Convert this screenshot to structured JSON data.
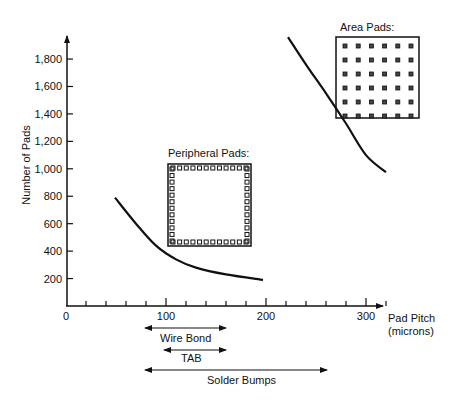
{
  "chart_data": {
    "type": "line",
    "title": "",
    "xlabel": "Pad Pitch (microns)",
    "xlabel_line1": "Pad Pitch",
    "xlabel_line2": "(microns)",
    "ylabel": "Number of Pads",
    "xlim": [
      0,
      330
    ],
    "ylim": [
      0,
      2000
    ],
    "x_ticks": [
      0,
      100,
      200,
      300
    ],
    "x_tick_labels": [
      "0",
      "100",
      "200",
      "300"
    ],
    "y_ticks": [
      200,
      400,
      600,
      800,
      1000,
      1200,
      1400,
      1600,
      1800
    ],
    "y_tick_labels": [
      "200",
      "400",
      "600",
      "800",
      "1,000",
      "1,200",
      "1,400",
      "1,600",
      "1,800"
    ],
    "series": [
      {
        "name": "Peripheral Pads",
        "x": [
          49,
          70,
          90,
          110,
          130,
          160,
          197
        ],
        "y": [
          790,
          600,
          440,
          340,
          280,
          230,
          190
        ]
      },
      {
        "name": "Area Pads",
        "x": [
          222,
          240,
          260,
          280,
          300,
          320
        ],
        "y": [
          1960,
          1760,
          1550,
          1330,
          1100,
          975
        ]
      }
    ],
    "annotations": [
      {
        "label": "Peripheral Pads:",
        "type": "inset-diagram"
      },
      {
        "label": "Area Pads:",
        "type": "inset-diagram"
      }
    ],
    "ranges": [
      {
        "label": "Wire Bond",
        "from": 80,
        "to": 160
      },
      {
        "label": "TAB",
        "from": 100,
        "to": 160
      },
      {
        "label": "Solder Bumps",
        "from": 80,
        "to": 262
      }
    ],
    "grid": false
  },
  "labels": {
    "peripheral": "Peripheral Pads:",
    "area": "Area Pads:",
    "wire_bond": "Wire Bond",
    "tab": "TAB",
    "solder": "Solder Bumps"
  }
}
